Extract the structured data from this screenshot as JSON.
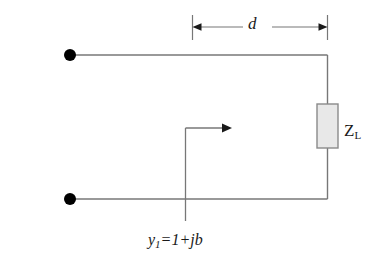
{
  "figure": {
    "background_color": "#ffffff",
    "line_color": "#777777",
    "terminal_color": "#000000",
    "load_fill_color": "#e8e8e8",
    "load_border_color": "#8a8a8a",
    "text_color": "#1a1a1a"
  },
  "labels": {
    "distance": "d",
    "load_symbol": "Z",
    "load_subscript": "L",
    "admittance_var": "y",
    "admittance_subscript": "1",
    "admittance_expression": "=1+jb"
  },
  "geometry": {
    "top_conductor_y": 55,
    "bottom_conductor_y": 199,
    "left_terminal_x": 70,
    "right_conductor_x": 327,
    "dimension_line_y": 27,
    "dimension_left_x": 192,
    "dimension_right_x": 327,
    "load_box": {
      "x": 317,
      "y": 104,
      "width": 21,
      "height": 44
    },
    "stub_x": 185,
    "stub_top_y": 128,
    "stub_bottom_y": 221,
    "stub_arrow_tip_x": 232,
    "terminal_radius": 6
  }
}
